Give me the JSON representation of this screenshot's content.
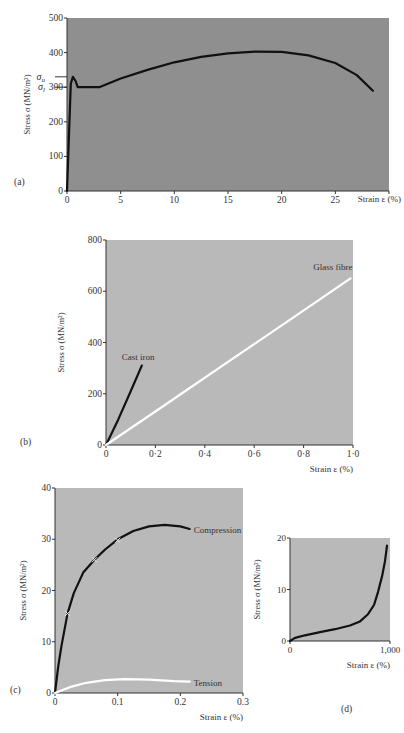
{
  "chart_data": [
    {
      "id": "a",
      "panel_label": "(a)",
      "type": "line",
      "title": "",
      "xlabel": "Strain ε (%)",
      "ylabel": "Stress σ (MN/m²)",
      "xlim": [
        0,
        30
      ],
      "ylim": [
        0,
        500
      ],
      "xticks": [
        0,
        5,
        10,
        15,
        20,
        25,
        30
      ],
      "xtick_labels": [
        "0",
        "5",
        "10",
        "15",
        "20",
        "25",
        ""
      ],
      "yticks": [
        0,
        100,
        200,
        300,
        400,
        500
      ],
      "ytick_labels": [
        "0",
        "100",
        "200",
        "300",
        "400",
        "500"
      ],
      "annotations": [
        {
          "text": "σu",
          "y": 330,
          "note": "upper yield stress"
        },
        {
          "text": "σl",
          "y": 300,
          "note": "lower yield stress"
        }
      ],
      "grid": false,
      "background": "#8f8f8f",
      "series": [
        {
          "name": "Mild steel",
          "color": "#111111",
          "x": [
            0,
            0.35,
            0.55,
            0.8,
            1.0,
            2.0,
            3.0,
            5,
            7.5,
            10,
            12.5,
            15,
            17.5,
            20,
            22.5,
            25,
            27,
            28.5
          ],
          "y": [
            0,
            310,
            330,
            318,
            300,
            300,
            300,
            325,
            350,
            372,
            388,
            398,
            403,
            402,
            392,
            370,
            335,
            290
          ]
        }
      ]
    },
    {
      "id": "b",
      "panel_label": "(b)",
      "type": "line",
      "title": "",
      "xlabel": "Strain ε (%)",
      "ylabel": "Stress σ (MN/m²)",
      "xlim": [
        0,
        1.0
      ],
      "ylim": [
        0,
        800
      ],
      "xticks": [
        0,
        0.2,
        0.4,
        0.6,
        0.8,
        1.0
      ],
      "xtick_labels": [
        "0",
        "0·2",
        "0·4",
        "0·6",
        "0·8",
        "1·0"
      ],
      "yticks": [
        0,
        200,
        400,
        600,
        800
      ],
      "ytick_labels": [
        "0",
        "200",
        "400",
        "600",
        "800"
      ],
      "grid": false,
      "background": "#b9b9b9",
      "series": [
        {
          "name": "Cast iron",
          "label": "Cast iron",
          "color": "#111111",
          "x": [
            0,
            0.05,
            0.1,
            0.145
          ],
          "y": [
            0,
            100,
            210,
            310
          ]
        },
        {
          "name": "Glass fibre",
          "label": "Glass fibre",
          "color": "#ffffff",
          "x": [
            0,
            0.25,
            0.5,
            0.75,
            0.99
          ],
          "y": [
            0,
            164,
            328,
            492,
            650
          ]
        }
      ]
    },
    {
      "id": "c",
      "panel_label": "(c)",
      "type": "line",
      "title": "",
      "xlabel": "Strain ε (%)",
      "ylabel": "Stress σ (MN/m²)",
      "xlim": [
        0,
        0.3
      ],
      "ylim": [
        0,
        40
      ],
      "xticks": [
        0,
        0.1,
        0.2,
        0.3
      ],
      "xtick_labels": [
        "0",
        "0.1",
        "0.2",
        "0.3"
      ],
      "yticks": [
        0,
        10,
        20,
        30,
        40
      ],
      "ytick_labels": [
        "0",
        "10",
        "20",
        "30",
        "40"
      ],
      "grid": false,
      "background": "#b9b9b9",
      "series": [
        {
          "name": "Compression",
          "label": "Compression",
          "color": "#111111",
          "x": [
            0,
            0.005,
            0.01,
            0.02,
            0.03,
            0.045,
            0.063,
            0.08,
            0.1,
            0.125,
            0.15,
            0.175,
            0.2,
            0.215
          ],
          "y": [
            0,
            5,
            9,
            15.5,
            19.5,
            23.5,
            26,
            28,
            30,
            31.6,
            32.5,
            32.8,
            32.5,
            32
          ],
          "markers": [
            {
              "x": 0.02,
              "y": 15.5
            },
            {
              "x": 0.063,
              "y": 26
            },
            {
              "x": 0.1,
              "y": 29.8
            }
          ]
        },
        {
          "name": "Tension",
          "label": "Tension",
          "color": "#ffffff",
          "x": [
            0,
            0.025,
            0.05,
            0.08,
            0.11,
            0.15,
            0.19,
            0.215
          ],
          "y": [
            0,
            1.2,
            2.0,
            2.5,
            2.7,
            2.6,
            2.3,
            2.2
          ]
        }
      ]
    },
    {
      "id": "d",
      "panel_label": "(d)",
      "type": "line",
      "title": "",
      "xlabel": "Strain ε (%)",
      "ylabel": "Stress σ (MN/m²)",
      "xlim": [
        0,
        1000
      ],
      "ylim": [
        0,
        20
      ],
      "xticks": [
        0,
        1000
      ],
      "xtick_labels": [
        "0",
        "1,000"
      ],
      "yticks": [
        0,
        10,
        20
      ],
      "ytick_labels": [
        "0",
        "10",
        "20"
      ],
      "grid": false,
      "background": "#b9b9b9",
      "series": [
        {
          "name": "Rubber",
          "color": "#111111",
          "x": [
            0,
            50,
            150,
            300,
            450,
            600,
            700,
            780,
            840,
            880,
            920,
            950,
            970
          ],
          "y": [
            0,
            0.6,
            1.1,
            1.7,
            2.3,
            3.0,
            3.8,
            5.2,
            7.0,
            9.5,
            12.5,
            15.5,
            18.5
          ]
        }
      ]
    }
  ]
}
